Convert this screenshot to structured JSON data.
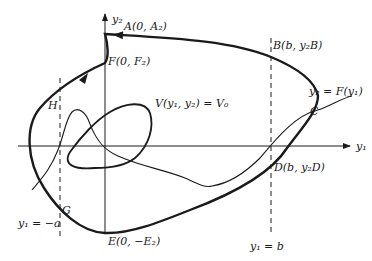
{
  "diagram": {
    "type": "phase-plane",
    "axes": {
      "x_label": "y₁",
      "y_label": "y₂"
    },
    "points": {
      "A": "A(0, A₂)",
      "B": "B(b, y₂B)",
      "C": "C",
      "D": "D(b, y₂D)",
      "E": "E(0, −E₂)",
      "F": "F(0, F₂)",
      "G": "G",
      "H": "H"
    },
    "curves": {
      "level_curve": "V(y₁, y₂) = V₀",
      "graph": "y₂ = F(y₁)"
    },
    "lines": {
      "left": "y₁ = −a",
      "right": "y₁ = b"
    },
    "colors": {
      "ink": "#1a1a1a",
      "background": "#ffffff"
    }
  }
}
